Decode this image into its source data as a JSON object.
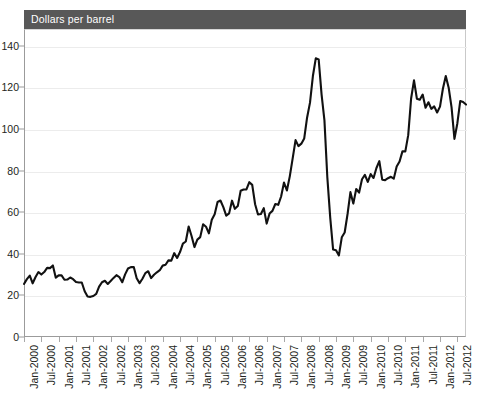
{
  "figure": {
    "cutoff_title": "Crude oil price, 2000–2012",
    "series_header_label": "Dollars per barrel",
    "header_bg": "#585858",
    "header_text_color": "#ffffff",
    "line_color": "#111111",
    "grid_color": "#ececec",
    "axis_color": "#9b9b9b"
  },
  "chart_data": {
    "type": "line",
    "title": "Dollars per barrel",
    "xlabel": "",
    "ylabel": "",
    "ylim": [
      0,
      148
    ],
    "yticks": [
      0,
      20,
      40,
      60,
      80,
      100,
      120,
      140
    ],
    "grid": true,
    "legend": false,
    "legend_position": "none",
    "x_tick_labels": [
      "Jan-2000",
      "Jul-2000",
      "Jan-2001",
      "Jul-2001",
      "Jan-2002",
      "Jul-2002",
      "Jan-2003",
      "Jul-2003",
      "Jan-2004",
      "Jul-2004",
      "Jan-2005",
      "Jul-2005",
      "Jan-2006",
      "Jul-2006",
      "Jan-2007",
      "Jul-2007",
      "Jan-2008",
      "Jul-2008",
      "Jan-2009",
      "Jul-2009",
      "Jan-2010",
      "Jul-2010",
      "Jan-2011",
      "Jul-2011",
      "Jan-2012",
      "Jul-2012"
    ],
    "x_start": "Jan-2000",
    "x_end": "Oct-2012",
    "x_frequency": "monthly",
    "series": [
      {
        "name": "Dollars per barrel",
        "values": [
          25.5,
          27.8,
          29.5,
          25.8,
          28.8,
          31.2,
          30.0,
          31.2,
          33.2,
          33.1,
          34.4,
          28.5,
          29.6,
          29.6,
          27.5,
          27.6,
          28.6,
          27.8,
          26.4,
          26.2,
          26.2,
          22.0,
          19.5,
          19.3,
          19.7,
          20.7,
          24.2,
          26.3,
          27.0,
          25.5,
          26.9,
          28.4,
          29.7,
          28.8,
          26.3,
          30.1,
          32.9,
          33.6,
          33.6,
          28.2,
          25.9,
          28.0,
          30.7,
          31.6,
          28.3,
          29.9,
          31.1,
          32.1,
          34.3,
          34.7,
          36.8,
          36.7,
          40.3,
          38.0,
          40.8,
          44.9,
          45.9,
          53.1,
          48.5,
          43.2,
          46.8,
          48.0,
          54.2,
          53.0,
          49.8,
          56.3,
          59.0,
          64.9,
          65.6,
          62.4,
          58.3,
          59.4,
          65.5,
          61.6,
          62.9,
          70.3,
          70.9,
          70.9,
          74.4,
          73.1,
          63.8,
          58.9,
          59.1,
          61.9,
          54.5,
          59.3,
          60.6,
          63.9,
          63.5,
          67.5,
          74.2,
          70.4,
          77.2,
          85.8,
          94.6,
          91.7,
          92.9,
          95.4,
          105.5,
          112.6,
          125.4,
          133.9,
          133.4,
          116.6,
          104.1,
          76.7,
          57.4,
          42.0,
          41.7,
          39.2,
          47.9,
          50.2,
          59.1,
          69.6,
          64.1,
          71.1,
          69.4,
          75.8,
          77.9,
          74.5,
          78.3,
          76.4,
          81.2,
          84.5,
          75.6,
          75.4,
          76.3,
          77.0,
          76.1,
          81.9,
          84.3,
          89.2,
          89.2,
          97.0,
          114.6,
          123.3,
          114.5,
          114.0,
          116.5,
          110.2,
          112.8,
          109.6,
          110.8,
          107.9,
          110.7,
          119.3,
          125.4,
          119.8,
          110.3,
          95.2,
          102.6,
          113.4,
          112.9,
          111.7
        ]
      }
    ]
  }
}
